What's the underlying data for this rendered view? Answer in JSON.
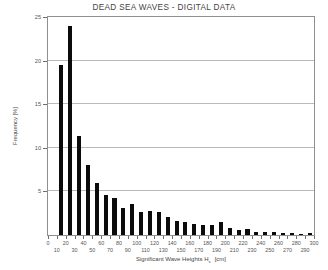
{
  "chart_data": {
    "type": "bar",
    "title": "DEAD SEA WAVES - DIGITAL DATA",
    "xlabel": "Significant Wave Heights Hs  [cm]",
    "xlabel_main": "Significant Wave Heights H",
    "xlabel_sub": "s",
    "xlabel_units": "[cm]",
    "ylabel": "Frequency [%]",
    "xlim": [
      0,
      300
    ],
    "ylim": [
      0,
      25
    ],
    "grid": true,
    "legend": "none",
    "bar_color": "#0b0b0b",
    "bin_width": 10,
    "x_tick_values": [
      0,
      10,
      20,
      30,
      40,
      50,
      60,
      70,
      80,
      90,
      100,
      110,
      120,
      130,
      140,
      150,
      160,
      170,
      180,
      190,
      200,
      210,
      220,
      230,
      240,
      250,
      260,
      270,
      280,
      290,
      300
    ],
    "x_tick_labels_top": [
      0,
      20,
      40,
      60,
      80,
      100,
      120,
      140,
      160,
      180,
      200,
      220,
      240,
      260,
      280,
      300
    ],
    "x_tick_labels_bottom": [
      10,
      30,
      50,
      70,
      90,
      110,
      130,
      150,
      170,
      190,
      210,
      230,
      250,
      270,
      290
    ],
    "y_tick_values": [
      5,
      10,
      15,
      20,
      25
    ],
    "categories": [
      "0-10",
      "10-20",
      "20-30",
      "30-40",
      "40-50",
      "50-60",
      "60-70",
      "70-80",
      "80-90",
      "90-100",
      "100-110",
      "110-120",
      "120-130",
      "130-140",
      "140-150",
      "150-160",
      "160-170",
      "170-180",
      "180-190",
      "190-200",
      "200-210",
      "210-220",
      "220-230",
      "230-240",
      "240-250",
      "250-260",
      "260-270",
      "270-280",
      "280-290",
      "290-300"
    ],
    "bin_starts": [
      0,
      10,
      20,
      30,
      40,
      50,
      60,
      70,
      80,
      90,
      100,
      110,
      120,
      130,
      140,
      150,
      160,
      170,
      180,
      190,
      200,
      210,
      220,
      230,
      240,
      250,
      260,
      270,
      280,
      290
    ],
    "values": [
      0,
      19.5,
      24.0,
      11.4,
      8.0,
      6.0,
      4.6,
      4.2,
      3.1,
      3.5,
      2.6,
      2.7,
      2.6,
      2.1,
      1.6,
      1.5,
      1.3,
      1.2,
      1.1,
      1.5,
      0.8,
      0.6,
      0.7,
      0.4,
      0.4,
      0.4,
      0.25,
      0.2,
      0.15,
      0.2
    ]
  }
}
